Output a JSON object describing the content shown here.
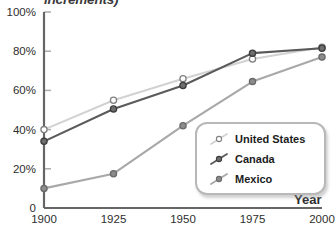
{
  "chart_data": {
    "type": "line",
    "title": "increments)",
    "xlabel": "Year",
    "ylabel": "",
    "x": [
      1900,
      1925,
      1950,
      1975,
      2000
    ],
    "xtick_labels": [
      "1900",
      "1925",
      "1950",
      "1975",
      "2000"
    ],
    "ytick_labels": [
      "0",
      "20%",
      "40%",
      "60%",
      "80%",
      "100%"
    ],
    "ytick_values": [
      0,
      20,
      40,
      60,
      80,
      100
    ],
    "ylim": [
      0,
      100
    ],
    "xlim": [
      1900,
      2000
    ],
    "grid": false,
    "legend_position": "bottom-right",
    "series": [
      {
        "name": "United States",
        "values": [
          40,
          55,
          66,
          76,
          82
        ],
        "color": "#d2d2d2",
        "marker": "open-circle",
        "marker_fill": "#ffffff",
        "marker_stroke": "#808080"
      },
      {
        "name": "Canada",
        "values": [
          34,
          50.5,
          62.5,
          79,
          81.5
        ],
        "color": "#5a5a5a",
        "marker": "filled-circle",
        "marker_fill": "#6e6e6e",
        "marker_stroke": "#3c3c3c"
      },
      {
        "name": "Mexico",
        "values": [
          10,
          17.5,
          42,
          64.5,
          77
        ],
        "color": "#a8a8a8",
        "marker": "filled-circle",
        "marker_fill": "#8c8c8c",
        "marker_stroke": "#6a6a6a"
      }
    ]
  },
  "axis": {
    "axis_color": "#666666",
    "tick_color": "#b0b0b0"
  }
}
